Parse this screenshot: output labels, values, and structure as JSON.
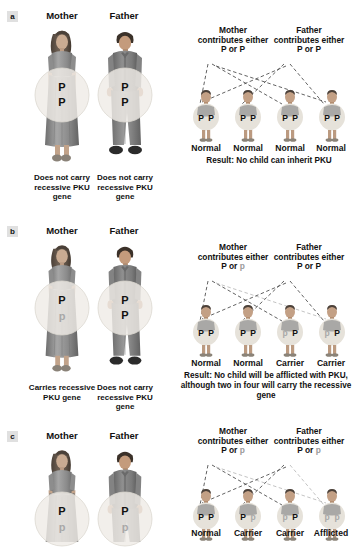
{
  "figure": {
    "topic": "PKU inheritance patterns",
    "allele_dominant": "P",
    "allele_recessive": "p",
    "colors": {
      "text": "#111111",
      "recessive_gray": "#9a9a9a",
      "circle_fill": "#ebe9e4",
      "panel_tag_bg": "#e0e0e0",
      "figure_gray": "#8e8e8e"
    }
  },
  "panels": [
    {
      "letter": "a",
      "mother_title": "Mother",
      "father_title": "Father",
      "mother_circle": {
        "top": "P",
        "bottom": "P",
        "top_type": "dominant",
        "bottom_type": "dominant"
      },
      "father_circle": {
        "top": "P",
        "bottom": "P",
        "top_type": "dominant",
        "bottom_type": "dominant"
      },
      "mother_caption": "Does not carry recessive PKU gene",
      "father_caption": "Does not carry recessive PKU gene",
      "mother_contributes_line1": "Mother",
      "mother_contributes_line2": "contributes either",
      "mother_contributes_alleles": [
        "P",
        "or",
        "P"
      ],
      "mother_allele_types": [
        "dominant",
        "dominant"
      ],
      "father_contributes_line1": "Father",
      "father_contributes_line2": "contributes either",
      "father_contributes_alleles": [
        "P",
        "or",
        "P"
      ],
      "father_allele_types": [
        "dominant",
        "dominant"
      ],
      "children": [
        {
          "left_allele": "P",
          "left_type": "dominant",
          "right_allele": "P",
          "right_type": "dominant",
          "label": "Normal"
        },
        {
          "left_allele": "P",
          "left_type": "dominant",
          "right_allele": "P",
          "right_type": "dominant",
          "label": "Normal"
        },
        {
          "left_allele": "P",
          "left_type": "dominant",
          "right_allele": "P",
          "right_type": "dominant",
          "label": "Normal"
        },
        {
          "left_allele": "P",
          "left_type": "dominant",
          "right_allele": "P",
          "right_type": "dominant",
          "label": "Normal"
        }
      ],
      "result_lines": [
        "Result: No child can inherit PKU"
      ]
    },
    {
      "letter": "b",
      "mother_title": "Mother",
      "father_title": "Father",
      "mother_circle": {
        "top": "P",
        "bottom": "p",
        "top_type": "dominant",
        "bottom_type": "recessive"
      },
      "father_circle": {
        "top": "P",
        "bottom": "P",
        "top_type": "dominant",
        "bottom_type": "dominant"
      },
      "mother_caption": "Carries recessive PKU gene",
      "father_caption": "Does not carry recessive PKU gene",
      "mother_contributes_line1": "Mother",
      "mother_contributes_line2": "contributes either",
      "mother_contributes_alleles": [
        "P",
        "or",
        "p"
      ],
      "mother_allele_types": [
        "dominant",
        "recessive"
      ],
      "father_contributes_line1": "Father",
      "father_contributes_line2": "contributes either",
      "father_contributes_alleles": [
        "P",
        "or",
        "P"
      ],
      "father_allele_types": [
        "dominant",
        "dominant"
      ],
      "children": [
        {
          "left_allele": "P",
          "left_type": "dominant",
          "right_allele": "P",
          "right_type": "dominant",
          "label": "Normal"
        },
        {
          "left_allele": "P",
          "left_type": "dominant",
          "right_allele": "P",
          "right_type": "dominant",
          "label": "Normal"
        },
        {
          "left_allele": "p",
          "left_type": "recessive",
          "right_allele": "P",
          "right_type": "dominant",
          "label": "Carrier"
        },
        {
          "left_allele": "p",
          "left_type": "recessive",
          "right_allele": "P",
          "right_type": "dominant",
          "label": "Carrier"
        }
      ],
      "result_lines": [
        "Result: No child will be afflicted with PKU,",
        "although two in four will carry the recessive gene"
      ]
    },
    {
      "letter": "c",
      "mother_title": "Mother",
      "father_title": "Father",
      "mother_circle": {
        "top": "P",
        "bottom": "p",
        "top_type": "dominant",
        "bottom_type": "recessive"
      },
      "father_circle": {
        "top": "P",
        "bottom": "p",
        "top_type": "dominant",
        "bottom_type": "recessive"
      },
      "mother_caption": "",
      "father_caption": "",
      "mother_contributes_line1": "Mother",
      "mother_contributes_line2": "contributes either",
      "mother_contributes_alleles": [
        "P",
        "or",
        "p"
      ],
      "mother_allele_types": [
        "dominant",
        "recessive"
      ],
      "father_contributes_line1": "Father",
      "father_contributes_line2": "contributes either",
      "father_contributes_alleles": [
        "P",
        "or",
        "p"
      ],
      "father_allele_types": [
        "dominant",
        "recessive"
      ],
      "children": [
        {
          "left_allele": "P",
          "left_type": "dominant",
          "right_allele": "P",
          "right_type": "dominant",
          "label": "Normal"
        },
        {
          "left_allele": "P",
          "left_type": "dominant",
          "right_allele": "p",
          "right_type": "recessive",
          "label": "Carrier"
        },
        {
          "left_allele": "p",
          "left_type": "recessive",
          "right_allele": "P",
          "right_type": "dominant",
          "label": "Carrier"
        },
        {
          "left_allele": "p",
          "left_type": "recessive",
          "right_allele": "p",
          "right_type": "recessive",
          "label": "Afflicted"
        }
      ],
      "result_lines": []
    }
  ]
}
